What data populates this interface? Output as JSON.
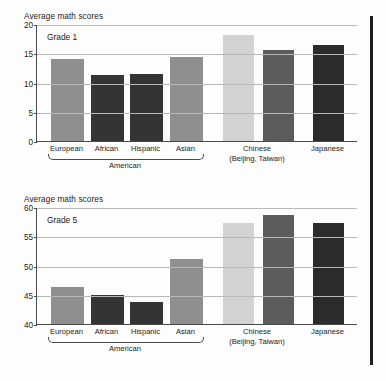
{
  "figure": {
    "right_rule": "vertical-rule"
  },
  "charts": [
    {
      "id": "grade1",
      "axis_title": "Average math scores",
      "grade_label": "Grade 1",
      "ylim": [
        0,
        20
      ],
      "yticks": [
        "0",
        "5",
        "10",
        "15",
        "20"
      ],
      "ytick_values": [
        0,
        5,
        10,
        15,
        20
      ],
      "group_brace_label": "American",
      "categories": [
        "European",
        "African",
        "Hispanic",
        "Asian",
        "Chinese",
        "Japanese"
      ],
      "bar_labels": [
        "European",
        "African",
        "Hispanic",
        "Asian",
        "",
        "",
        "Japanese"
      ],
      "chinese_label_line1": "Chinese",
      "chinese_label_line2": "(Beijing, Taiwan)",
      "values": [
        14.1,
        11.3,
        11.5,
        14.4,
        18.2,
        15.6,
        16.4
      ],
      "colors": [
        "#8f8f8f",
        "#343434",
        "#343434",
        "#8f8f8f",
        "#d2d2d2",
        "#5c5c5c",
        "#2b2b2b"
      ]
    },
    {
      "id": "grade5",
      "axis_title": "Average math scores",
      "grade_label": "Grade 5",
      "ylim": [
        40,
        60
      ],
      "yticks": [
        "40",
        "45",
        "50",
        "55",
        "60"
      ],
      "ytick_values": [
        40,
        45,
        50,
        55,
        60
      ],
      "group_brace_label": "American",
      "categories": [
        "European",
        "African",
        "Hispanic",
        "Asian",
        "Chinese",
        "Japanese"
      ],
      "bar_labels": [
        "European",
        "African",
        "Hispanic",
        "Asian",
        "",
        "",
        "Japanese"
      ],
      "chinese_label_line1": "Chinese",
      "chinese_label_line2": "(Beijing, Taiwan)",
      "values": [
        46.3,
        44.9,
        43.7,
        51.1,
        57.2,
        58.6,
        57.3
      ],
      "colors": [
        "#8f8f8f",
        "#343434",
        "#343434",
        "#8f8f8f",
        "#d2d2d2",
        "#5c5c5c",
        "#2b2b2b"
      ]
    }
  ],
  "chart_data": [
    {
      "type": "bar",
      "title": "Average math scores",
      "subtitle": "Grade 1",
      "xlabel": "",
      "ylabel": "Average math scores",
      "ylim": [
        0,
        20
      ],
      "yticks": [
        0,
        5,
        10,
        15,
        20
      ],
      "grid": true,
      "legend": "none",
      "categories": [
        "European American",
        "African American",
        "Hispanic American",
        "Asian American",
        "Chinese (Beijing)",
        "Chinese (Taiwan)",
        "Japanese"
      ],
      "values": [
        14.1,
        11.3,
        11.5,
        14.4,
        18.2,
        15.6,
        16.4
      ],
      "annotations": [
        "Grade 1",
        "American brace spans European/African/Hispanic/Asian",
        "Chinese (Beijing, Taiwan) spans two bars"
      ]
    },
    {
      "type": "bar",
      "title": "Average math scores",
      "subtitle": "Grade 5",
      "xlabel": "",
      "ylabel": "Average math scores",
      "ylim": [
        40,
        60
      ],
      "yticks": [
        40,
        45,
        50,
        55,
        60
      ],
      "grid": true,
      "legend": "none",
      "categories": [
        "European American",
        "African American",
        "Hispanic American",
        "Asian American",
        "Chinese (Beijing)",
        "Chinese (Taiwan)",
        "Japanese"
      ],
      "values": [
        46.3,
        44.9,
        43.7,
        51.1,
        57.2,
        58.6,
        57.3
      ],
      "annotations": [
        "Grade 5",
        "American brace spans European/African/Hispanic/Asian",
        "Chinese (Beijing, Taiwan) spans two bars"
      ]
    }
  ]
}
